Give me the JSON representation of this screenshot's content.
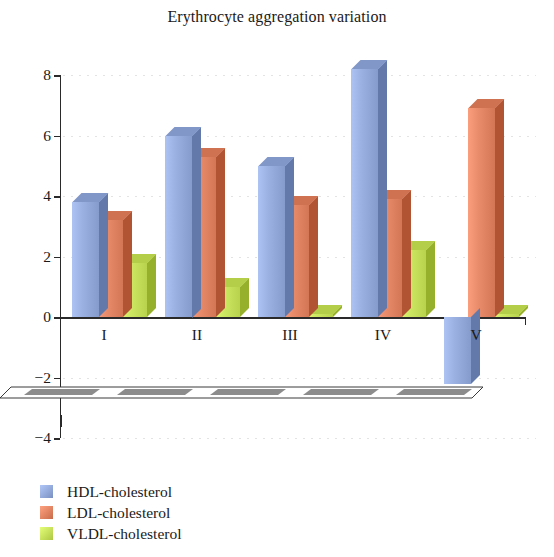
{
  "chart_data": {
    "type": "bar",
    "title": "Erythrocyte aggregation variation",
    "xlabel": "",
    "ylabel": "",
    "categories": [
      "I",
      "II",
      "III",
      "IV",
      "V"
    ],
    "series": [
      {
        "name": "HDL-cholesterol",
        "color": "#92a9da",
        "values": [
          3.8,
          6.0,
          5.0,
          8.2,
          -2.2
        ]
      },
      {
        "name": "LDL-cholesterol",
        "color": "#e08463",
        "values": [
          3.2,
          5.3,
          3.7,
          3.9,
          6.9
        ]
      },
      {
        "name": "VLDL-cholesterol",
        "color": "#c6e05c",
        "values": [
          1.8,
          1.0,
          0.1,
          2.2,
          0.1
        ]
      }
    ],
    "ylim": [
      -4,
      8
    ],
    "yticks": [
      -4,
      -2,
      0,
      2,
      4,
      6,
      8
    ],
    "ytick_labels": [
      "−4",
      "−2",
      "0",
      "2",
      "4",
      "6",
      "8"
    ],
    "grid": true,
    "grid_style": "dotted",
    "legend_position": "bottom-left",
    "style_3d": true
  },
  "legend": {
    "items": [
      {
        "label": "HDL-cholesterol",
        "color": "#92a9da"
      },
      {
        "label": "LDL-cholesterol",
        "color": "#e08463"
      },
      {
        "label": "VLDL-cholesterol",
        "color": "#c6e05c"
      }
    ]
  },
  "colors": {
    "axis": "#2a2a2a",
    "grid": "#b5b5b5",
    "text": "#1a1a1a",
    "background": "#ffffff",
    "floor_fill": "#8c8c8c"
  }
}
